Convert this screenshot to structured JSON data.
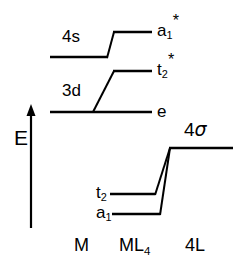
{
  "figure": {
    "background_color": "#ffffff",
    "line_color": "#000000"
  },
  "axis": {
    "label": "E",
    "direction": "up",
    "meaning": "energy-increasing-upward"
  },
  "columns": [
    {
      "key": "metal",
      "label": "M"
    },
    {
      "key": "complex",
      "label_main": "ML",
      "label_sub": "4"
    },
    {
      "key": "ligands",
      "label": "4L"
    }
  ],
  "orbitals": {
    "metal": [
      {
        "key": "4s",
        "label": "4s",
        "label_side": "above-left"
      },
      {
        "key": "3d",
        "label": "3d",
        "label_side": "above-left"
      }
    ],
    "complex_antibonding": [
      {
        "key": "a1star",
        "base": "a",
        "sub": "1",
        "star": "*",
        "label_side": "right"
      },
      {
        "key": "t2star",
        "base": "t",
        "sub": "2",
        "star": "*",
        "label_side": "right"
      },
      {
        "key": "e",
        "base": "e",
        "sub": "",
        "star": "",
        "label_side": "right"
      }
    ],
    "complex_bonding": [
      {
        "key": "t2",
        "base": "t",
        "sub": "2",
        "star": "",
        "label_side": "left"
      },
      {
        "key": "a1",
        "base": "a",
        "sub": "1",
        "star": "",
        "label_side": "left"
      }
    ],
    "ligand": [
      {
        "key": "4sigma",
        "label_num": "4",
        "label_greek": "σ",
        "label_side": "above"
      }
    ]
  },
  "geometry": {
    "levels": [
      {
        "key": "4s",
        "x1": 50,
        "x2": 108,
        "y": 57
      },
      {
        "key": "a1star",
        "x1": 113,
        "x2": 152,
        "y": 32
      },
      {
        "key": "t2star",
        "x1": 113,
        "x2": 152,
        "y": 71
      },
      {
        "key": "3d",
        "x1": 50,
        "x2": 152,
        "y": 112
      },
      {
        "key": "4sigma",
        "x1": 170,
        "x2": 233,
        "y": 148
      },
      {
        "key": "t2",
        "x1": 110,
        "x2": 155,
        "y": 194
      },
      {
        "key": "a1",
        "x1": 112,
        "x2": 160,
        "y": 214
      }
    ],
    "correlations": [
      {
        "from": "4s-right",
        "x1": 108,
        "y1": 57,
        "x2": 113,
        "y2": 32
      },
      {
        "from": "3d-mid",
        "x1": 93,
        "y1": 112,
        "x2": 113,
        "y2": 71
      },
      {
        "from": "t2-right",
        "x1": 155,
        "y1": 194,
        "x2": 170,
        "y2": 148
      },
      {
        "from": "a1-right",
        "x1": 160,
        "y1": 214,
        "x2": 170,
        "y2": 148
      }
    ],
    "axis_arrow": {
      "x": 31,
      "y_top": 104,
      "y_bottom": 228,
      "head_half_width": 4,
      "head_height": 10
    }
  },
  "labels": {
    "four_s": {
      "text": "4s",
      "x": 62,
      "y": 28
    },
    "three_d": {
      "text": "3d",
      "x": 62,
      "y": 82
    },
    "a1_star": {
      "x": 157,
      "y": 22
    },
    "t2_star": {
      "x": 157,
      "y": 61
    },
    "e": {
      "text": "e",
      "x": 157,
      "y": 103
    },
    "t2": {
      "x": 96,
      "y": 184
    },
    "a1": {
      "x": 96,
      "y": 204
    },
    "four_sigma": {
      "x": 184,
      "y": 120
    },
    "axis_E": {
      "text": "E",
      "x": 14,
      "y": 127
    },
    "col_M": {
      "text": "M",
      "x": 74,
      "y": 236
    },
    "col_ML4": {
      "main": "ML",
      "sub": "4",
      "x": 119,
      "y": 236
    },
    "col_4L": {
      "text": "4L",
      "x": 185,
      "y": 236
    }
  }
}
